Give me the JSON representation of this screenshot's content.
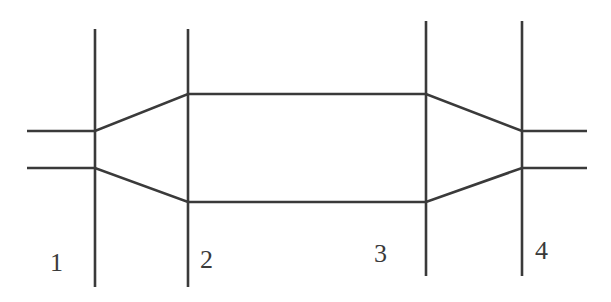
{
  "diagram": {
    "type": "duct-section-schematic",
    "stroke_color": "#3a3a3a",
    "background": "#ffffff",
    "sections": [
      {
        "id": "1",
        "label": "1",
        "x": 95,
        "y1": 29,
        "y2": 287,
        "label_x": 50,
        "label_y": 271
      },
      {
        "id": "2",
        "label": "2",
        "x": 188,
        "y1": 29,
        "y2": 287,
        "label_x": 200,
        "label_y": 268
      },
      {
        "id": "3",
        "label": "3",
        "x": 426,
        "y1": 21,
        "y2": 276,
        "label_x": 374,
        "label_y": 262
      },
      {
        "id": "4",
        "label": "4",
        "x": 522,
        "y1": 21,
        "y2": 276,
        "label_x": 535,
        "label_y": 259
      }
    ],
    "walls": {
      "upper": [
        [
          27,
          131
        ],
        [
          95,
          131
        ],
        [
          188,
          94
        ],
        [
          426,
          94
        ],
        [
          522,
          131
        ],
        [
          587,
          131
        ]
      ],
      "lower": [
        [
          27,
          168
        ],
        [
          95,
          168
        ],
        [
          188,
          202
        ],
        [
          426,
          202
        ],
        [
          522,
          168
        ],
        [
          587,
          168
        ]
      ]
    }
  }
}
